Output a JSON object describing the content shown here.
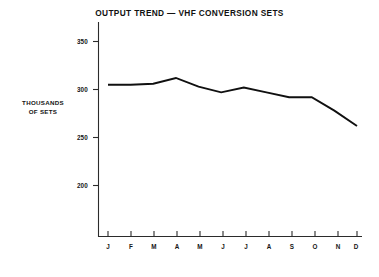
{
  "figure": {
    "title": "OUTPUT TREND — VHF CONVERSION SETS",
    "y_axis_caption_line1": "THOUSANDS",
    "y_axis_caption_line2": "OF SETS",
    "footer_note": "19–3",
    "background_color": "#ffffff",
    "line_color": "#101010",
    "axis_color": "#2b2b2b"
  },
  "chart_data": {
    "type": "line",
    "title": "OUTPUT TREND — VHF CONVERSION SETS",
    "xlabel": "",
    "ylabel": "THOUSANDS OF SETS",
    "categories": [
      "J",
      "F",
      "M",
      "A",
      "M",
      "J",
      "J",
      "A",
      "S",
      "O",
      "N",
      "D"
    ],
    "values": [
      305,
      305,
      306,
      312,
      303,
      297,
      302,
      297,
      292,
      292,
      278,
      262
    ],
    "series": [
      {
        "name": "VHF conversion sets output",
        "values": [
          305,
          305,
          306,
          312,
          303,
          297,
          302,
          297,
          292,
          292,
          278,
          262
        ]
      }
    ],
    "ylim": [
      185,
      360
    ],
    "yticks": [
      200,
      250,
      300,
      350
    ],
    "ytick_labels": [
      "200",
      "250",
      "300",
      "350"
    ],
    "xtick_labels": [
      "J",
      "F",
      "M",
      "A",
      "M",
      "J",
      "J",
      "A",
      "S",
      "O",
      "N",
      "D"
    ],
    "grid": false,
    "legend": false,
    "legend_position": "none"
  }
}
